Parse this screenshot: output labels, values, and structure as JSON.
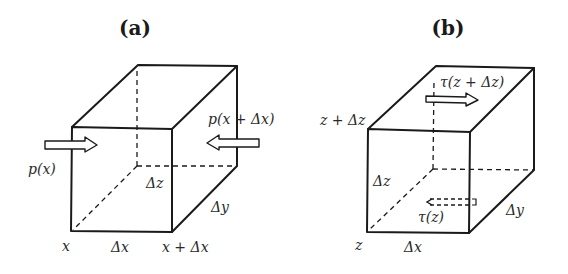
{
  "figure": {
    "panel_a": {
      "label": "(a)",
      "labels": {
        "force_left": "p(x)",
        "force_right": "p(x + Δx)",
        "dz": "Δz",
        "dy": "Δy",
        "dx": "Δx",
        "x_start": "x",
        "x_end": "x + Δx"
      }
    },
    "panel_b": {
      "label": "(b)",
      "labels": {
        "stress_top": "τ(z + Δz)",
        "stress_bottom": "τ(z)",
        "z_top": "z + Δz",
        "z_bottom": "z",
        "dz": "Δz",
        "dy": "Δy",
        "dx": "Δx"
      }
    }
  }
}
